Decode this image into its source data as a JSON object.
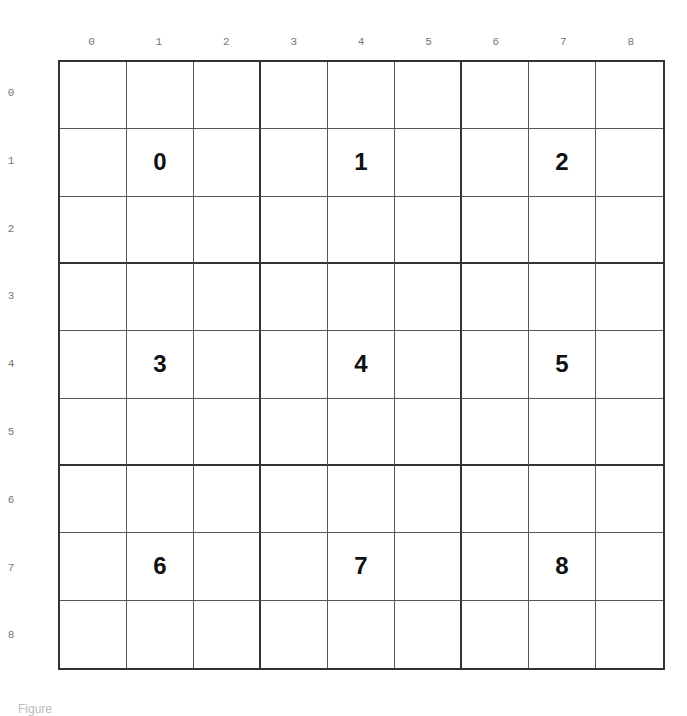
{
  "grid": {
    "rows": 9,
    "cols": 9,
    "column_labels": [
      "0",
      "1",
      "2",
      "3",
      "4",
      "5",
      "6",
      "7",
      "8"
    ],
    "row_labels": [
      "0",
      "1",
      "2",
      "3",
      "4",
      "5",
      "6",
      "7",
      "8"
    ],
    "box_size": 3,
    "box_numbers": [
      {
        "row": 1,
        "col": 1,
        "label": "0"
      },
      {
        "row": 1,
        "col": 4,
        "label": "1"
      },
      {
        "row": 1,
        "col": 7,
        "label": "2"
      },
      {
        "row": 4,
        "col": 1,
        "label": "3"
      },
      {
        "row": 4,
        "col": 4,
        "label": "4"
      },
      {
        "row": 4,
        "col": 7,
        "label": "5"
      },
      {
        "row": 7,
        "col": 1,
        "label": "6"
      },
      {
        "row": 7,
        "col": 4,
        "label": "7"
      },
      {
        "row": 7,
        "col": 8,
        "label": "8"
      }
    ]
  },
  "caption": "Figure"
}
